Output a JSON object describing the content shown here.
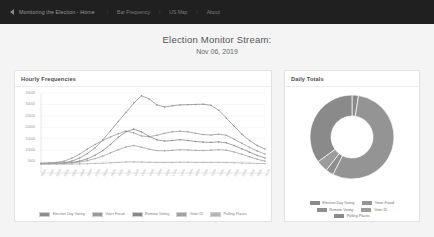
{
  "navbar": {
    "caret_icon": "chevron-left-icon",
    "brand": "Monitoring the Election - Home",
    "items": [
      "Bar Frequency",
      "US Map",
      "About"
    ],
    "separator": "/"
  },
  "header": {
    "title": "Election Monitor Stream:",
    "date": "Nov 06, 2019"
  },
  "cards": {
    "hourly": {
      "title": "Hourly Frequencies"
    },
    "daily": {
      "title": "Daily Totals"
    }
  },
  "colors": {
    "navbar_bg": "#202020",
    "page_bg": "#f4f4f4",
    "card_bg": "#ffffff",
    "series": [
      "#8e8e8e",
      "#9a9a9a",
      "#888888",
      "#a2a2a2",
      "#b4b4b4"
    ],
    "donut": [
      "#8b8b8b",
      "#949494",
      "#8e8e8e",
      "#9c9c9c",
      "#8a8a8a"
    ]
  },
  "chart_data": [
    {
      "type": "line",
      "title": "Hourly Frequencies",
      "xlabel": "",
      "ylabel": "",
      "ylim": [
        0,
        35000
      ],
      "grid": true,
      "legend_position": "bottom",
      "yticks": [
        5000,
        10000,
        15000,
        20000,
        25000,
        30000,
        35000
      ],
      "ytick_labels": [
        "5000",
        "10000",
        "15000",
        "20000",
        "25000",
        "30000",
        "35000"
      ],
      "categories": [
        "00:00",
        "01:00",
        "02:00",
        "03:00",
        "04:00",
        "05:00",
        "06:00",
        "07:00",
        "08:00",
        "09:00",
        "10:00",
        "11:00",
        "12:00",
        "13:00",
        "14:00",
        "15:00",
        "16:00",
        "17:00",
        "18:00",
        "19:00",
        "20:00",
        "21:00",
        "22:00",
        "23:00",
        "00:00",
        "01:00",
        "02:00",
        "03:00",
        "04:00",
        "05:00"
      ],
      "series": [
        {
          "name": "Election Day Voting",
          "values": [
            4200,
            4300,
            4400,
            4500,
            5200,
            6600,
            8500,
            11000,
            14500,
            18500,
            22500,
            26500,
            30500,
            33800,
            32400,
            29800,
            28900,
            29400,
            29800,
            29900,
            30000,
            30100,
            29600,
            27500,
            24000,
            20500,
            17000,
            14200,
            12000,
            10500
          ]
        },
        {
          "name": "Voter Fraud",
          "values": [
            4300,
            4400,
            4600,
            5200,
            6500,
            8200,
            10500,
            12500,
            14200,
            15800,
            17200,
            18300,
            17600,
            16200,
            15900,
            16500,
            17400,
            18000,
            18300,
            18000,
            17400,
            16800,
            16600,
            17000,
            16500,
            14800,
            13000,
            11200,
            9600,
            8300
          ]
        },
        {
          "name": "Remote Voting",
          "values": [
            4100,
            4150,
            4200,
            4300,
            4600,
            5200,
            6200,
            7800,
            9800,
            12500,
            15600,
            18000,
            19200,
            18000,
            16000,
            14500,
            14000,
            14200,
            14600,
            14200,
            13800,
            13500,
            13400,
            13600,
            13200,
            12000,
            10600,
            9100,
            7700,
            6600
          ]
        },
        {
          "name": "Voter ID",
          "values": [
            4000,
            4050,
            4100,
            4200,
            4400,
            4800,
            5400,
            6300,
            7400,
            8800,
            10200,
            11400,
            12000,
            11300,
            10400,
            9800,
            9700,
            9900,
            10200,
            10100,
            9900,
            9800,
            10000,
            10200,
            10000,
            9200,
            8200,
            7100,
            6000,
            5200
          ]
        },
        {
          "name": "Polling Places",
          "values": [
            3800,
            3820,
            3850,
            3880,
            3920,
            3980,
            4050,
            4150,
            4280,
            4450,
            4620,
            4780,
            4850,
            4760,
            4650,
            4600,
            4600,
            4640,
            4680,
            4660,
            4630,
            4610,
            4620,
            4640,
            4600,
            4500,
            4380,
            4260,
            4160,
            4080
          ]
        }
      ]
    },
    {
      "type": "pie",
      "subtype": "donut",
      "title": "Daily Totals",
      "legend_position": "bottom",
      "labels": [
        "Election Day Voting",
        "Voter Fraud",
        "Remote Voting",
        "Voter ID",
        "Polling Places"
      ],
      "values": [
        2.5,
        55.0,
        3.0,
        4.5,
        35.0
      ]
    }
  ]
}
